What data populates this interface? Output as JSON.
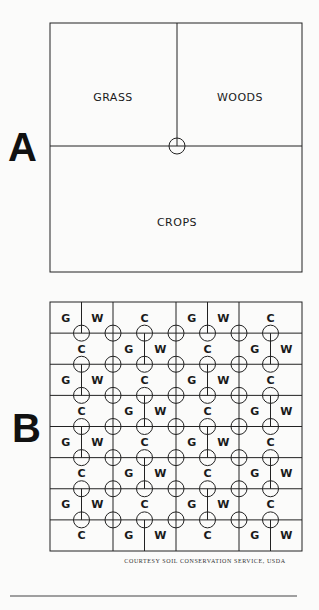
{
  "diagram_a": {
    "letter": "A",
    "box": {
      "x": 50,
      "y": 23,
      "w": 252,
      "h": 249
    },
    "horizontal_line_y": 146,
    "vertical_line_x": 177,
    "circle": {
      "cx": 177,
      "cy": 146,
      "r": 8
    },
    "labels": [
      {
        "text": "GRASS",
        "x": 113,
        "y": 101
      },
      {
        "text": "WOODS",
        "x": 240,
        "y": 101
      },
      {
        "text": "CROPS",
        "x": 177,
        "y": 226
      }
    ]
  },
  "diagram_b": {
    "letter": "B",
    "box": {
      "x": 50,
      "y": 302,
      "w": 252,
      "h": 249
    },
    "rows": 8,
    "cols": 8,
    "circle_radius": 8,
    "legend_codes": {
      "G": "Grass",
      "W": "Woods",
      "C": "Crops"
    },
    "row_patterns": {
      "even": [
        {
          "label": "G",
          "span": 1
        },
        {
          "label": "W",
          "span": 1
        },
        {
          "label": "C",
          "span": 2
        },
        {
          "label": "G",
          "span": 1
        },
        {
          "label": "W",
          "span": 1
        },
        {
          "label": "C",
          "span": 2
        }
      ],
      "odd": [
        {
          "label": "C",
          "span": 2
        },
        {
          "label": "G",
          "span": 1
        },
        {
          "label": "W",
          "span": 1
        },
        {
          "label": "C",
          "span": 2
        },
        {
          "label": "G",
          "span": 1
        },
        {
          "label": "W",
          "span": 1
        }
      ]
    }
  },
  "caption": "COURTESY SOIL CONSERVATION SERVICE, USDA",
  "footer_rule": {
    "x1": 10,
    "x2": 297,
    "y": 596
  }
}
